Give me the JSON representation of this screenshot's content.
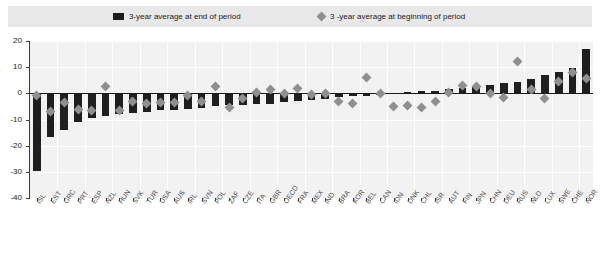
{
  "legend": {
    "entries": [
      {
        "label": "3-year average at end of period",
        "marker": "bar-swatch",
        "color": "#1c1c1c"
      },
      {
        "label": "3 -year average at beginning of period",
        "marker": "diamond-swatch",
        "color": "#8f8f8f"
      }
    ]
  },
  "colors": {
    "bar": "#1f1f1f",
    "marker": "#8f8f8f",
    "plot_background": "#f2f2f2",
    "legend_background": "#e8e8e8",
    "gridline": "#ffffff",
    "axis": "#3a3a3a"
  },
  "chart_data": {
    "type": "bar",
    "title": "",
    "subtitle": "",
    "xlabel": "",
    "ylabel": "",
    "ylim": [
      -40,
      20
    ],
    "yticks": [
      20,
      10,
      0,
      -10,
      -20,
      -30,
      -40
    ],
    "ytick_labels": [
      "20",
      "10",
      "0",
      "-10",
      "-20",
      "-30",
      "-40"
    ],
    "grid": true,
    "legend_position": "top",
    "categories": [
      "ISL",
      "EST",
      "GRC",
      "PRT",
      "ESP",
      "NZL",
      "HUN",
      "SVK",
      "TUR",
      "USA",
      "AUS",
      "IRL",
      "SVN",
      "POL",
      "ZAF",
      "CZE",
      "ITA",
      "GBR",
      "OECD",
      "FRA",
      "MEX",
      "IND",
      "BRA",
      "KOR",
      "BEL",
      "CAN",
      "IDN",
      "DNK",
      "CHL",
      "ISR",
      "AUT",
      "FIN",
      "JPN",
      "CHN",
      "DEU",
      "RUS",
      "NLD",
      "LUX",
      "SWE",
      "CHE",
      "NOR"
    ],
    "series": [
      {
        "name": "3-year average at end of period",
        "type": "bar",
        "color": "#1f1f1f",
        "values": [
          -29.5,
          -16.5,
          -14.0,
          -11.0,
          -9.5,
          -8.5,
          -8.0,
          -7.5,
          -7.0,
          -6.5,
          -6.5,
          -6.0,
          -5.5,
          -5.0,
          -4.5,
          -4.5,
          -4.0,
          -4.0,
          -3.5,
          -3.0,
          -2.5,
          -2.0,
          -1.5,
          -1.0,
          -1.0,
          -0.5,
          0.0,
          0.5,
          1.0,
          1.0,
          1.5,
          2.0,
          2.5,
          3.0,
          4.0,
          4.5,
          5.5,
          7.0,
          8.0,
          9.5,
          17.0
        ]
      },
      {
        "name": "3 -year average at beginning of period",
        "type": "scatter",
        "color": "#8f8f8f",
        "marker": "diamond",
        "values": [
          -1.0,
          -7.0,
          -3.5,
          -6.0,
          -6.5,
          2.5,
          -6.5,
          -3.0,
          -4.0,
          -3.5,
          -3.5,
          -1.0,
          -3.0,
          2.5,
          -5.5,
          -2.0,
          0.5,
          1.5,
          0.0,
          2.0,
          -0.5,
          0.0,
          -3.0,
          -4.0,
          6.0,
          0.0,
          -5.0,
          -4.5,
          -5.5,
          -3.0,
          0.5,
          3.0,
          2.5,
          0.0,
          -1.5,
          12.0,
          1.5,
          -2.0,
          4.5,
          8.0,
          5.5
        ]
      }
    ]
  }
}
